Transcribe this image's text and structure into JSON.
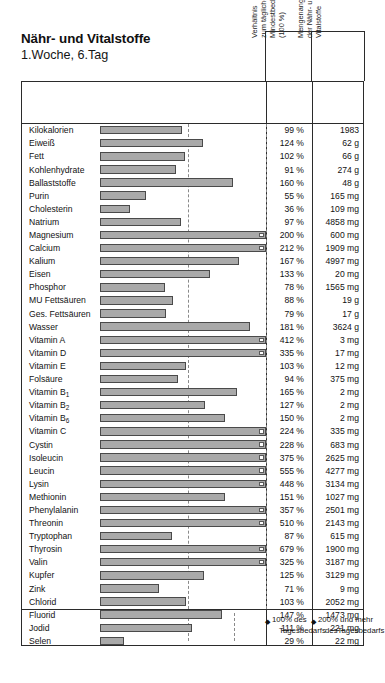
{
  "title": {
    "main": "Nähr- und Vitalstoffe",
    "sub": "1.Woche, 6.Tag"
  },
  "columns": {
    "label_header": "",
    "bar_header": "",
    "pct_header": "Verhältnis\nzum täglichen\nMindestbedarf\n(100 %)",
    "amount_header": "Mengenangabe\nder Nähr- und\nVitalstoffe"
  },
  "legend": {
    "ref_marker": "◆",
    "ref_line1": "100% des",
    "ref_line2": "Tagesbedarfs",
    "over_marker": "◆",
    "over_line1": "200% und mehr",
    "over_line2": "desTagesbedarfs"
  },
  "colors": {
    "bar_fill": "#a9a9a9",
    "bar_stroke": "#4a4a4a",
    "frame": "#2b2b2b",
    "dashline": "#8a8a8a",
    "overflow_cap": "#fdfdfd"
  },
  "chart_data": {
    "type": "bar",
    "xlabel": "Verhältnis zum täglichen Mindestbedarf (100 %)",
    "ylabel": "",
    "orientation": "horizontal",
    "xlim": [
      0,
      200
    ],
    "reference_line": 100,
    "overflow_threshold": 200,
    "grid": false,
    "legend_position": "bottom-right",
    "categories": [
      "Kilokalorien",
      "Eiweiß",
      "Fett",
      "Kohlenhydrate",
      "Ballaststoffe",
      "Purin",
      "Cholesterin",
      "Natrium",
      "Magnesium",
      "Calcium",
      "Kalium",
      "Eisen",
      "Phosphor",
      "MU Fettsäuren",
      "Ges. Fettsäuren",
      "Wasser",
      "Vitamin A",
      "Vitamin D",
      "Vitamin E",
      "Folsäure",
      "Vitamin B1",
      "Vitamin B2",
      "Vitamin B6",
      "Vitamin C",
      "Cystin",
      "Isoleucin",
      "Leucin",
      "Lysin",
      "Methionin",
      "Phenylalanin",
      "Threonin",
      "Tryptophan",
      "Thyrosin",
      "Valin",
      "Kupfer",
      "Zink",
      "Chlorid",
      "Fluorid",
      "Jodid",
      "Selen"
    ],
    "values": [
      99,
      124,
      102,
      91,
      160,
      55,
      36,
      97,
      200,
      212,
      167,
      133,
      78,
      88,
      79,
      181,
      412,
      335,
      103,
      94,
      165,
      127,
      150,
      224,
      228,
      375,
      555,
      448,
      151,
      357,
      510,
      87,
      679,
      325,
      125,
      71,
      103,
      147,
      111,
      29
    ],
    "units": "percent of daily minimum requirement"
  },
  "rows": [
    {
      "label": "Kilokalorien",
      "sub": "",
      "pct": 99,
      "pct_text": "99 %",
      "amount": "1983"
    },
    {
      "label": "Eiweiß",
      "sub": "",
      "pct": 124,
      "pct_text": "124 %",
      "amount": "62 g"
    },
    {
      "label": "Fett",
      "sub": "",
      "pct": 102,
      "pct_text": "102 %",
      "amount": "66 g"
    },
    {
      "label": "Kohlenhydrate",
      "sub": "",
      "pct": 91,
      "pct_text": "91 %",
      "amount": "274 g"
    },
    {
      "label": "Ballaststoffe",
      "sub": "",
      "pct": 160,
      "pct_text": "160 %",
      "amount": "48 g"
    },
    {
      "label": "Purin",
      "sub": "",
      "pct": 55,
      "pct_text": "55 %",
      "amount": "165 mg"
    },
    {
      "label": "Cholesterin",
      "sub": "",
      "pct": 36,
      "pct_text": "36 %",
      "amount": "109 mg"
    },
    {
      "label": "Natrium",
      "sub": "",
      "pct": 97,
      "pct_text": "97 %",
      "amount": "4858 mg"
    },
    {
      "label": "Magnesium",
      "sub": "",
      "pct": 200,
      "pct_text": "200 %",
      "amount": "600 mg"
    },
    {
      "label": "Calcium",
      "sub": "",
      "pct": 212,
      "pct_text": "212 %",
      "amount": "1909 mg"
    },
    {
      "label": "Kalium",
      "sub": "",
      "pct": 167,
      "pct_text": "167 %",
      "amount": "4997 mg"
    },
    {
      "label": "Eisen",
      "sub": "",
      "pct": 133,
      "pct_text": "133 %",
      "amount": "20 mg"
    },
    {
      "label": "Phosphor",
      "sub": "",
      "pct": 78,
      "pct_text": "78 %",
      "amount": "1565 mg"
    },
    {
      "label": "MU Fettsäuren",
      "sub": "",
      "pct": 88,
      "pct_text": "88 %",
      "amount": "19 g"
    },
    {
      "label": "Ges. Fettsäuren",
      "sub": "",
      "pct": 79,
      "pct_text": "79 %",
      "amount": "17 g"
    },
    {
      "label": "Wasser",
      "sub": "",
      "pct": 181,
      "pct_text": "181 %",
      "amount": "3624 g"
    },
    {
      "label": "Vitamin A",
      "sub": "",
      "pct": 412,
      "pct_text": "412 %",
      "amount": "3 mg"
    },
    {
      "label": "Vitamin D",
      "sub": "",
      "pct": 335,
      "pct_text": "335 %",
      "amount": "17 mg"
    },
    {
      "label": "Vitamin E",
      "sub": "",
      "pct": 103,
      "pct_text": "103 %",
      "amount": "12 mg"
    },
    {
      "label": "Folsäure",
      "sub": "",
      "pct": 94,
      "pct_text": "94 %",
      "amount": "375 mg"
    },
    {
      "label": "Vitamin B",
      "sub": "1",
      "pct": 165,
      "pct_text": "165 %",
      "amount": "2 mg"
    },
    {
      "label": "Vitamin B",
      "sub": "2",
      "pct": 127,
      "pct_text": "127 %",
      "amount": "2 mg"
    },
    {
      "label": "Vitamin B",
      "sub": "6",
      "pct": 150,
      "pct_text": "150 %",
      "amount": "2 mg"
    },
    {
      "label": "Vitamin C",
      "sub": "",
      "pct": 224,
      "pct_text": "224 %",
      "amount": "335 mg"
    },
    {
      "label": "Cystin",
      "sub": "",
      "pct": 228,
      "pct_text": "228 %",
      "amount": "683 mg"
    },
    {
      "label": "Isoleucin",
      "sub": "",
      "pct": 375,
      "pct_text": "375 %",
      "amount": "2625 mg"
    },
    {
      "label": "Leucin",
      "sub": "",
      "pct": 555,
      "pct_text": "555 %",
      "amount": "4277 mg"
    },
    {
      "label": "Lysin",
      "sub": "",
      "pct": 448,
      "pct_text": "448 %",
      "amount": "3134 mg"
    },
    {
      "label": "Methionin",
      "sub": "",
      "pct": 151,
      "pct_text": "151 %",
      "amount": "1027 mg"
    },
    {
      "label": "Phenylalanin",
      "sub": "",
      "pct": 357,
      "pct_text": "357 %",
      "amount": "2501 mg"
    },
    {
      "label": "Threonin",
      "sub": "",
      "pct": 510,
      "pct_text": "510 %",
      "amount": "2143 mg"
    },
    {
      "label": "Tryptophan",
      "sub": "",
      "pct": 87,
      "pct_text": "87 %",
      "amount": "615 mg"
    },
    {
      "label": "Thyrosin",
      "sub": "",
      "pct": 679,
      "pct_text": "679 %",
      "amount": "1900 mg"
    },
    {
      "label": "Valin",
      "sub": "",
      "pct": 325,
      "pct_text": "325 %",
      "amount": "3187 mg"
    },
    {
      "label": "Kupfer",
      "sub": "",
      "pct": 125,
      "pct_text": "125 %",
      "amount": "3129 mg"
    },
    {
      "label": "Zink",
      "sub": "",
      "pct": 71,
      "pct_text": "71 %",
      "amount": "9 mg"
    },
    {
      "label": "Chlorid",
      "sub": "",
      "pct": 103,
      "pct_text": "103 %",
      "amount": "2052 mg"
    },
    {
      "label": "Fluorid",
      "sub": "",
      "pct": 147,
      "pct_text": "147 %",
      "amount": "1473 mg"
    },
    {
      "label": "Jodid",
      "sub": "",
      "pct": 111,
      "pct_text": "111 %",
      "amount": "221 mg"
    },
    {
      "label": "Selen",
      "sub": "",
      "pct": 29,
      "pct_text": "29 %",
      "amount": "22 mg"
    }
  ]
}
